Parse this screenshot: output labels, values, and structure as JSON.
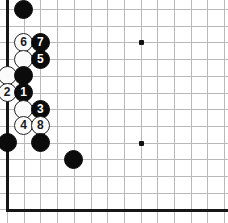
{
  "diagram": {
    "kind": "go-board-diagram",
    "board_size": 19,
    "view": {
      "width": 228,
      "height": 223,
      "origin_x": 7,
      "origin_y": 9,
      "spacing": 16.7,
      "columns_visible": 14,
      "rows_visible": 13,
      "left_edge_shown": true,
      "bottom_edge_shown": true,
      "top_edge_shown": false,
      "right_edge_shown": false
    },
    "colors": {
      "background": "#ffffff",
      "grid_line": "#b9b9b9",
      "board_edge": "#161616",
      "black_stone": "#0b0b0b",
      "white_stone": "#fbfbfb",
      "white_stone_outline": "#232323",
      "black_label_text": "#ffffff",
      "white_label_text": "#1a1a1a",
      "star_point": "#111111"
    },
    "star_points": [
      {
        "name": "star-point-upper",
        "col": 9,
        "row": 3
      },
      {
        "name": "star-point-lower",
        "col": 9,
        "row": 9
      }
    ],
    "stones": [
      {
        "name": "black-stone-top",
        "color": "black",
        "label": "",
        "col": 2,
        "row": 1
      },
      {
        "name": "white-stone-6",
        "color": "white",
        "label": "6",
        "col": 2,
        "row": 3
      },
      {
        "name": "black-stone-7",
        "color": "black",
        "label": "7",
        "col": 3,
        "row": 3
      },
      {
        "name": "white-stone-plain-upper",
        "color": "white",
        "label": "",
        "col": 2,
        "row": 4
      },
      {
        "name": "black-stone-5",
        "color": "black",
        "label": "5",
        "col": 3,
        "row": 4
      },
      {
        "name": "white-stone-plain-left",
        "color": "white",
        "label": "",
        "col": 1,
        "row": 5
      },
      {
        "name": "black-stone-plain-mid",
        "color": "black",
        "label": "",
        "col": 2,
        "row": 5
      },
      {
        "name": "white-stone-2",
        "color": "white",
        "label": "2",
        "col": 1,
        "row": 6
      },
      {
        "name": "black-stone-1",
        "color": "black",
        "label": "1",
        "col": 2,
        "row": 6
      },
      {
        "name": "white-stone-plain-lower",
        "color": "white",
        "label": "",
        "col": 2,
        "row": 7
      },
      {
        "name": "black-stone-3",
        "color": "black",
        "label": "3",
        "col": 3,
        "row": 7
      },
      {
        "name": "white-stone-4",
        "color": "white",
        "label": "4",
        "col": 2,
        "row": 8
      },
      {
        "name": "white-stone-8",
        "color": "white",
        "label": "8",
        "col": 3,
        "row": 8
      },
      {
        "name": "black-stone-bottom-left",
        "color": "black",
        "label": "",
        "col": 1,
        "row": 9
      },
      {
        "name": "black-stone-bottom-mid",
        "color": "black",
        "label": "",
        "col": 3,
        "row": 9
      },
      {
        "name": "black-stone-bottom-right",
        "color": "black",
        "label": "",
        "col": 5,
        "row": 10
      }
    ],
    "move_sequence": [
      "1",
      "2",
      "3",
      "4",
      "5",
      "6",
      "7",
      "8"
    ]
  }
}
